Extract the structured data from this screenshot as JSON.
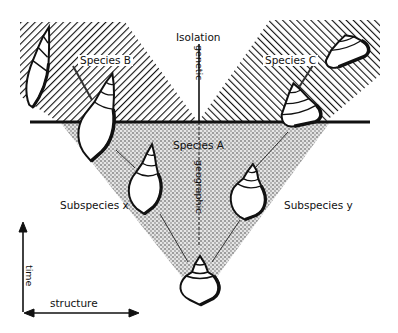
{
  "figure": {
    "labels": {
      "isolation": "Isolation",
      "genetic": "genetic",
      "geographic": "geographic",
      "species_a": "Species A",
      "species_b": "Species B",
      "species_c": "Species C",
      "subspecies_x": "Subspecies x",
      "subspecies_y": "Subspecies y",
      "time_axis": "time",
      "structure_axis": "structure"
    },
    "regions": [
      {
        "name": "species-b-region",
        "pattern": "diagonal-hatch-left"
      },
      {
        "name": "species-c-region",
        "pattern": "diagonal-hatch-right"
      },
      {
        "name": "species-a-region",
        "pattern": "stipple"
      }
    ],
    "shells": [
      {
        "name": "ancestral-shell",
        "position": "bottom-center"
      },
      {
        "name": "subspecies-x-shell",
        "position": "middle-left"
      },
      {
        "name": "subspecies-y-shell",
        "position": "middle-right"
      },
      {
        "name": "species-b-shell-1",
        "position": "upper-left-boundary"
      },
      {
        "name": "species-b-shell-2",
        "position": "top-left"
      },
      {
        "name": "species-c-shell-1",
        "position": "upper-right-boundary"
      },
      {
        "name": "species-c-shell-2",
        "position": "top-right"
      }
    ],
    "colors": {
      "ink": "#111111",
      "paper": "#ffffff",
      "stipple": "#9a9a9a"
    }
  }
}
